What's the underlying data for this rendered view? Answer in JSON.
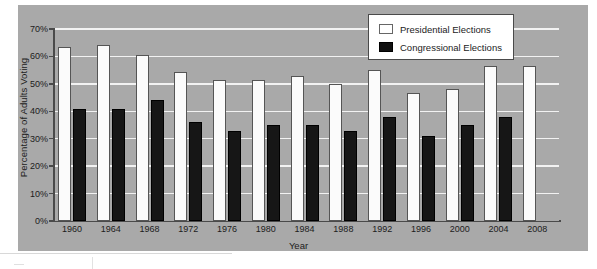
{
  "chart_data": {
    "type": "bar",
    "title": "",
    "xlabel": "Year",
    "ylabel": "Percentage of Adults Voting",
    "ylim": [
      0,
      70
    ],
    "ytick_labels": [
      "0%",
      "10%",
      "20%",
      "30%",
      "40%",
      "50%",
      "60%",
      "70%"
    ],
    "ytick_values": [
      0,
      10,
      20,
      30,
      40,
      50,
      60,
      70
    ],
    "grid": true,
    "legend_position": "top-right",
    "categories": [
      "1960",
      "1964",
      "1968",
      "1972",
      "1976",
      "1980",
      "1984",
      "1988",
      "1992",
      "1996",
      "2000",
      "2004",
      "2008"
    ],
    "series": [
      {
        "name": "Presidential Elections",
        "color": "#ffffff",
        "values": [
          63.5,
          64.0,
          60.5,
          54.5,
          51.5,
          51.5,
          53.0,
          50.0,
          55.0,
          46.5,
          48.0,
          56.5,
          56.5
        ]
      },
      {
        "name": "Congressional Elections",
        "color": "#111111",
        "values": [
          40.8,
          41.0,
          44.0,
          36.0,
          33.0,
          35.0,
          35.0,
          33.0,
          38.0,
          31.0,
          35.0,
          38.0,
          null
        ]
      }
    ]
  },
  "legend": {
    "items": [
      {
        "label": "Presidential Elections",
        "swatch": "white-square-icon"
      },
      {
        "label": "Congressional Elections",
        "swatch": "black-square-icon"
      }
    ]
  },
  "axes": {
    "y_title": "Percentage of Adults Voting",
    "x_title": "Year"
  }
}
